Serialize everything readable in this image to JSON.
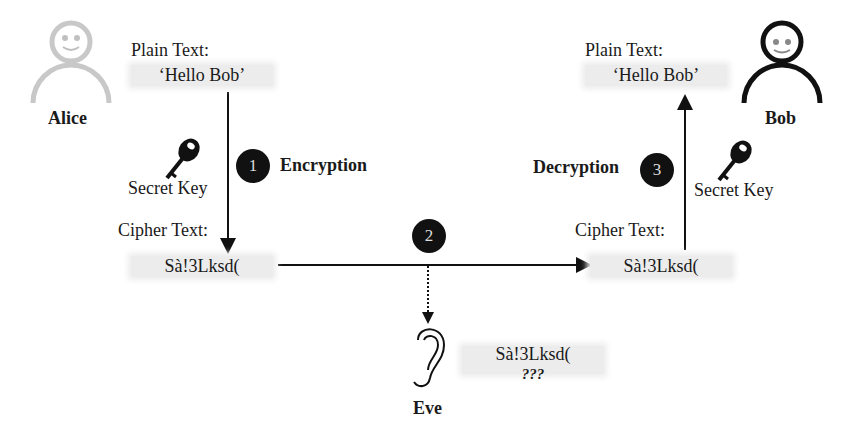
{
  "alice": {
    "name": "Alice",
    "plain_label": "Plain Text:",
    "plain_value": "‘Hello Bob’",
    "key_label": "Secret Key",
    "cipher_label": "Cipher Text:",
    "cipher_value": "Sà!3Lksd("
  },
  "bob": {
    "name": "Bob",
    "plain_label": "Plain Text:",
    "plain_value": "‘Hello Bob’",
    "key_label": "Secret Key",
    "cipher_label": "Cipher Text:",
    "cipher_value": "Sà!3Lksd("
  },
  "eve": {
    "name": "Eve",
    "cipher_value": "Sà!3Lksd(",
    "unknown": "???"
  },
  "steps": [
    {
      "number": "1",
      "label": "Encryption"
    },
    {
      "number": "2",
      "label": ""
    },
    {
      "number": "3",
      "label": "Decryption"
    }
  ],
  "colors": {
    "alice_figure": "#c8c8c8",
    "bob_figure": "#111111",
    "step_circle": "#111111",
    "text_box": "#ececec"
  }
}
